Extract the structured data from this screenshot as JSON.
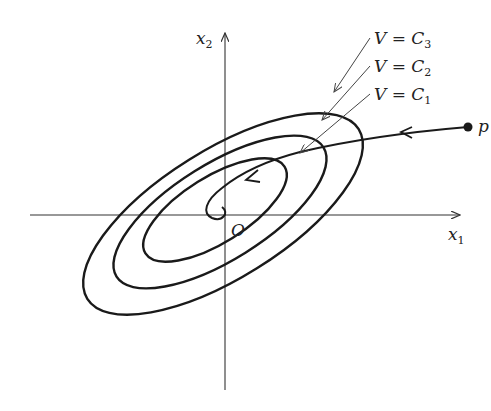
{
  "figure": {
    "axes": {
      "x_label": "x",
      "x_label_sub": "1",
      "y_label": "x",
      "y_label_sub": "2",
      "origin_label": "O"
    },
    "level_curves": [
      {
        "name": "V",
        "eq": " = C",
        "sub": "3"
      },
      {
        "name": "V",
        "eq": " = C",
        "sub": "2"
      },
      {
        "name": "V",
        "eq": " = C",
        "sub": "1"
      }
    ],
    "point_label": "p",
    "colors": {
      "stroke": "#1a1a1a",
      "axis": "#333333",
      "leader": "#444444",
      "background": "#ffffff"
    }
  }
}
